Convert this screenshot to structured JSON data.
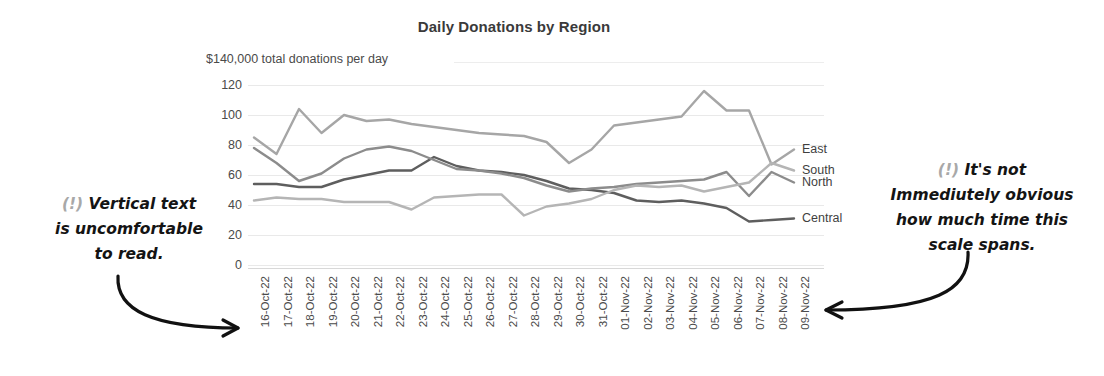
{
  "chart_data": {
    "type": "line",
    "title": "Daily Donations by Region",
    "subtitle": "$140,000 total donations per day",
    "xlabel": "",
    "ylabel": "",
    "ylim": [
      0,
      120
    ],
    "yticks": [
      120,
      100,
      80,
      60,
      40,
      20,
      0
    ],
    "grid": true,
    "legend_position": "right-end-labels",
    "categories": [
      "16-Oct-22",
      "17-Oct-22",
      "18-Oct-22",
      "19-Oct-22",
      "20-Oct-22",
      "21-Oct-22",
      "22-Oct-22",
      "23-Oct-22",
      "24-Oct-22",
      "25-Oct-22",
      "26-Oct-22",
      "27-Oct-22",
      "28-Oct-22",
      "29-Oct-22",
      "30-Oct-22",
      "31-Oct-22",
      "01-Nov-22",
      "02-Nov-22",
      "03-Nov-22",
      "04-Nov-22",
      "05-Nov-22",
      "06-Nov-22",
      "07-Nov-22",
      "08-Nov-22",
      "09-Nov-22"
    ],
    "series": [
      {
        "name": "East",
        "color": "#a6a6a6",
        "values": [
          85,
          74,
          104,
          88,
          100,
          96,
          97,
          94,
          92,
          90,
          88,
          87,
          86,
          82,
          68,
          77,
          93,
          95,
          97,
          99,
          116,
          103,
          103,
          67,
          77
        ]
      },
      {
        "name": "Central",
        "color": "#5e5e5e",
        "values": [
          54,
          54,
          52,
          52,
          57,
          60,
          63,
          63,
          72,
          66,
          63,
          62,
          60,
          56,
          51,
          50,
          48,
          43,
          42,
          43,
          41,
          38,
          29,
          30,
          31
        ]
      },
      {
        "name": "North",
        "color": "#8c8c8c",
        "values": [
          78,
          68,
          56,
          61,
          71,
          77,
          79,
          76,
          70,
          64,
          63,
          61,
          58,
          53,
          49,
          51,
          52,
          54,
          55,
          56,
          57,
          62,
          46,
          62,
          55
        ]
      },
      {
        "name": "South",
        "color": "#b5b5b5",
        "values": [
          43,
          45,
          44,
          44,
          42,
          42,
          42,
          37,
          45,
          46,
          47,
          47,
          33,
          39,
          41,
          44,
          50,
          53,
          52,
          53,
          49,
          52,
          55,
          68,
          63
        ]
      }
    ],
    "series_end_labels": [
      "East",
      "Central",
      "North",
      "South"
    ]
  },
  "annotations": {
    "left": {
      "marker": "(!)",
      "text": "Vertical text\nis uncomfortable\nto read.",
      "arrow": "curved-arrow-right"
    },
    "right": {
      "marker": "(!)",
      "text": "It's not\nImmediutely obvious\nhow much time this\nscale spans.",
      "arrow": "curved-arrow-left"
    }
  },
  "colors": {
    "title": "#3a3a3a",
    "axis_text": "#4a4a4a",
    "gridline": "#e9e9e9",
    "annotation_text": "#141414",
    "annotation_marker": "#a8a8a8"
  }
}
